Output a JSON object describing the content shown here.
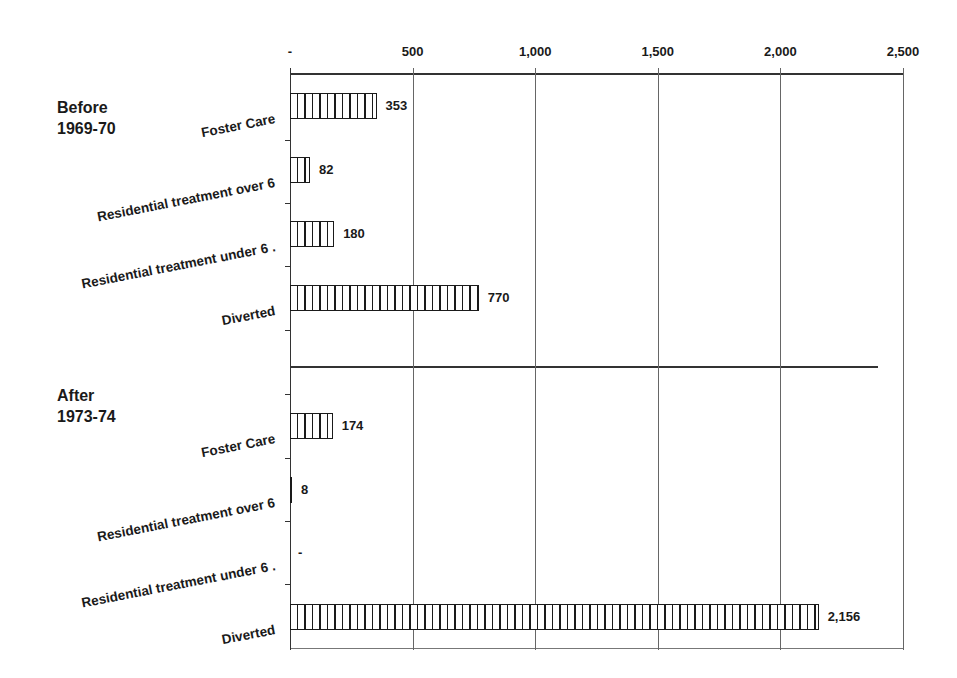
{
  "chart_data": {
    "type": "bar",
    "orientation": "horizontal",
    "title": "",
    "xlabel": "",
    "ylabel": "",
    "xlim": [
      0,
      2500
    ],
    "x_ticks": [
      0,
      500,
      1000,
      1500,
      2000,
      2500
    ],
    "x_tick_labels": [
      "-",
      "500",
      "1,000",
      "1,500",
      "2,000",
      "2,500"
    ],
    "grid": "vertical",
    "legend": null,
    "groups": [
      {
        "name": "Before 1969-70",
        "label_lines": "Before\n1969-70",
        "categories": [
          "Foster Care",
          "Residential treatment over 6",
          "Residential treatment under 6 .",
          "Diverted"
        ],
        "values": [
          353,
          82,
          180,
          770
        ],
        "value_labels": [
          "353",
          "82",
          "180",
          "770"
        ]
      },
      {
        "name": "After 1973-74",
        "label_lines": "After\n1973-74",
        "categories": [
          "Foster Care",
          "Residential treatment over 6",
          "Residential treatment under 6 .",
          "Diverted"
        ],
        "values": [
          174,
          8,
          0,
          2156
        ],
        "value_labels": [
          "174",
          "8",
          "-",
          "2,156"
        ]
      }
    ]
  },
  "colors": {
    "ink": "#1a1a1a",
    "background": "#ffffff"
  }
}
